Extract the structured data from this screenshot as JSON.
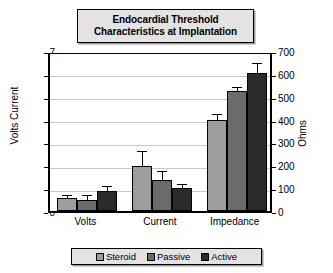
{
  "chart_data": {
    "type": "bar",
    "title": "Endocardial Threshold Characteristics at Implantation",
    "title_lines": [
      "Endocardial Threshold",
      "Characteristics at Implantation"
    ],
    "categories": [
      "Volts",
      "Current",
      "Impedance"
    ],
    "series": [
      {
        "name": "Steroid",
        "color": "#9d9d9d",
        "values": [
          0.55,
          1.95,
          4.0
        ],
        "errors": [
          0.1,
          0.65,
          0.22
        ]
      },
      {
        "name": "Passive",
        "color": "#6b6b6b",
        "values": [
          0.5,
          1.35,
          5.25
        ],
        "errors": [
          0.17,
          0.35,
          0.15
        ]
      },
      {
        "name": "Active",
        "color": "#2b2b2b",
        "values": [
          0.88,
          1.02,
          6.05
        ],
        "errors": [
          0.18,
          0.1,
          0.38
        ]
      }
    ],
    "ylabel": "Volts Current",
    "ylabel_right": "Ohms",
    "xlabel": "",
    "ylim": [
      0,
      7
    ],
    "ylim_right": [
      0,
      700
    ],
    "yticks": [
      "0",
      "1",
      "2",
      "3",
      "4",
      "5",
      "6",
      "7"
    ],
    "yticks_right": [
      "0",
      "100",
      "200",
      "300",
      "400",
      "500",
      "600",
      "700"
    ],
    "grid": true,
    "legend_position": "bottom",
    "units_note": "Left axis applies to Volts and Current; right axis (Ohms) applies to Impedance"
  }
}
